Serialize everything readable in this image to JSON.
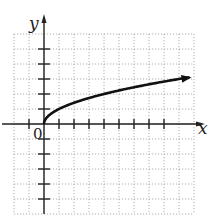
{
  "chart_data": {
    "type": "line",
    "title": "",
    "xlabel": "x",
    "ylabel": "y",
    "origin_label": "0",
    "function": "y = sqrt(x)",
    "xlim": [
      -2,
      10
    ],
    "ylim": [
      -6,
      6
    ],
    "grid": true,
    "grid_style": "dotted",
    "x_ticks": [
      -1,
      1,
      2,
      3,
      4,
      5,
      6,
      7,
      8
    ],
    "y_ticks": [
      -5,
      -4,
      -3,
      -2,
      -1,
      1,
      2,
      3,
      4,
      5
    ],
    "series": [
      {
        "name": "sqrt(x)",
        "x": [
          0,
          0.25,
          1,
          2,
          3,
          4,
          5,
          6,
          7,
          8,
          9,
          9.7
        ],
        "y": [
          0,
          0.5,
          1,
          1.41,
          1.73,
          2,
          2.24,
          2.45,
          2.65,
          2.83,
          3,
          3.11
        ],
        "arrow_end": true
      }
    ],
    "colors": {
      "curve": "#111111",
      "axes": "#222222",
      "grid": "#9a9a9a"
    }
  }
}
